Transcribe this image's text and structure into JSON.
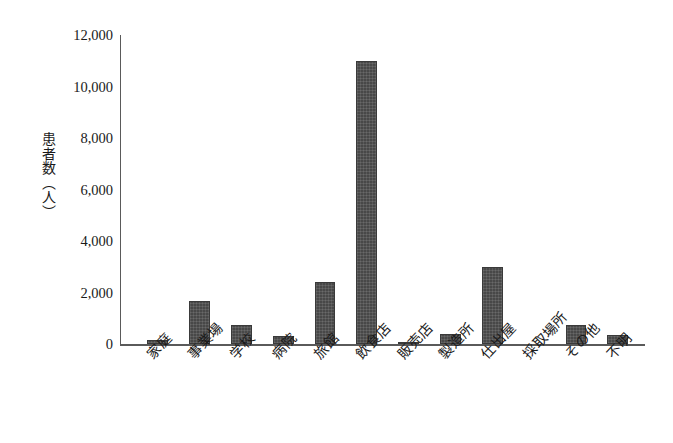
{
  "chart_data": {
    "type": "bar",
    "title": "",
    "subtitle": "",
    "xlabel": "",
    "ylabel": "患者数（人）",
    "ylabel_lines": [
      "患者数",
      "（人）"
    ],
    "categories": [
      "家庭",
      "事業場",
      "学校",
      "病院",
      "旅館",
      "飲食店",
      "販売店",
      "製造所",
      "仕出屋",
      "採取場所",
      "その他",
      "不明"
    ],
    "values": [
      160,
      1670,
      740,
      310,
      2400,
      11000,
      60,
      390,
      2990,
      0,
      750,
      350
    ],
    "ylim": [
      0,
      12000
    ],
    "yticks": [
      0,
      2000,
      4000,
      6000,
      8000,
      10000,
      12000
    ],
    "ytick_labels": [
      "0",
      "2,000",
      "4,000",
      "6,000",
      "8,000",
      "10,000",
      "12,000"
    ],
    "grid": false,
    "legend": null,
    "legend_position": "none",
    "bar_color": "#484848",
    "axis_color": "#5a5a5a",
    "background_color": "#ffffff",
    "annotations": []
  }
}
